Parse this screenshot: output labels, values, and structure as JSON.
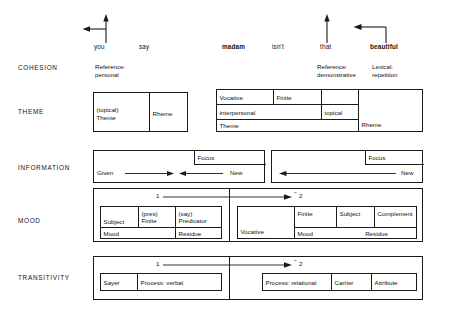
{
  "figure": {
    "clause_words": [
      {
        "text": "you",
        "bold": false,
        "x": 94,
        "y": 46
      },
      {
        "text": "say",
        "bold": false,
        "x": 139,
        "y": 46
      },
      {
        "text": "madam",
        "bold": true,
        "x": 222,
        "y": 46
      },
      {
        "text": "isn't",
        "bold": false,
        "x": 272,
        "y": 46
      },
      {
        "text": "that",
        "bold": false,
        "x": 320,
        "y": 46
      },
      {
        "text": "beautiful",
        "bold": true,
        "x": 370,
        "y": 46
      }
    ],
    "arrows": [
      {
        "name": "reference-personal-arrow",
        "kind": "up-left",
        "x": 82,
        "y": 14,
        "w": 28,
        "h": 30
      },
      {
        "name": "reference-demonstrative-arrow",
        "kind": "up",
        "x": 320,
        "y": 14,
        "w": 14,
        "h": 30
      },
      {
        "name": "lexical-repetition-arrow",
        "kind": "up-then-left",
        "x": 352,
        "y": 14,
        "w": 38,
        "h": 30
      }
    ],
    "rows": [
      {
        "label": "COHESION",
        "label_x": 18,
        "label_y": 68
      },
      {
        "label": "THEME",
        "label_x": 18,
        "label_y": 112
      },
      {
        "label": "INFORMATION",
        "label_x": 18,
        "label_y": 168
      },
      {
        "label": "MOOD",
        "label_x": 18,
        "label_y": 221
      },
      {
        "label": "TRANSITIVITY",
        "label_x": 18,
        "label_y": 277
      }
    ],
    "cohesion": {
      "notes": [
        {
          "name": "cohesion-note-reference-personal",
          "lines": [
            "Reference:",
            "personal"
          ],
          "x": 95,
          "y": 66
        },
        {
          "name": "cohesion-note-reference-demonstrative",
          "lines": [
            "Reference:",
            "demonstrative"
          ],
          "x": 317,
          "y": 66
        },
        {
          "name": "cohesion-note-lexical-repetition",
          "lines": [
            "Lexical:",
            "repetition"
          ],
          "x": 372,
          "y": 66
        }
      ]
    },
    "theme": {
      "left_box": {
        "x": 93,
        "y": 92,
        "w": 95,
        "h": 40,
        "divider_x": 55,
        "cells": [
          {
            "name": "theme-cell-topical-theme",
            "lines": [
              "(topical)",
              "Theme"
            ]
          },
          {
            "name": "theme-cell-rheme",
            "lines": [
              "Rheme"
            ]
          }
        ]
      },
      "right_box": {
        "x": 216,
        "y": 89,
        "w": 207,
        "h": 43,
        "cells": [
          {
            "name": "theme-cell-vocative",
            "text": "Vocative",
            "x": 0,
            "y": 0,
            "w": 56,
            "h": 14
          },
          {
            "name": "theme-cell-finite",
            "text": "Finite",
            "x": 56,
            "y": 0,
            "w": 48,
            "h": 14
          },
          {
            "name": "theme-cell-blank-top",
            "text": "",
            "x": 104,
            "y": 0,
            "w": 37,
            "h": 14
          },
          {
            "name": "theme-cell-interpersonal",
            "text": "interpersonal",
            "x": 0,
            "y": 14,
            "w": 104,
            "h": 15
          },
          {
            "name": "theme-cell-topical",
            "text": "topical",
            "x": 104,
            "y": 14,
            "w": 37,
            "h": 15
          },
          {
            "name": "theme-cell-theme",
            "text": "Theme",
            "x": 0,
            "y": 29,
            "w": 141,
            "h": 14
          },
          {
            "name": "theme-cell-rheme-right",
            "text": "Rheme",
            "x": 141,
            "y": 0,
            "w": 66,
            "h": 43
          }
        ]
      }
    },
    "information": {
      "left_box": {
        "x": 93,
        "y": 150,
        "w": 172,
        "h": 33,
        "focus_label": "Focus",
        "focus_x": 100,
        "focus_y": 0,
        "focus_w": 72,
        "focus_h": 14,
        "given_label": "Given",
        "new_label": "New",
        "arrow_style": "double-inward"
      },
      "right_box": {
        "x": 271,
        "y": 150,
        "w": 152,
        "h": 33,
        "focus_label": "Focus",
        "focus_x": 93,
        "focus_y": 0,
        "focus_w": 59,
        "focus_h": 14,
        "given_label": "",
        "new_label": "New",
        "arrow_style": "single-left"
      }
    },
    "mood": {
      "outer": {
        "x": 93,
        "y": 188,
        "w": 330,
        "h": 54,
        "split_x": 135
      },
      "clause_markers": {
        "one": "1",
        "two": "2",
        "two_superscript": "''",
        "one_x": 62,
        "two_x": 199,
        "y": 5,
        "arrow_from": 70,
        "arrow_to": 196
      },
      "left_box": {
        "x": 6,
        "y": 17,
        "w": 122,
        "h": 33,
        "top_cells": [
          {
            "name": "mood-cell-subject",
            "lines": [
              "Subject"
            ],
            "w": 38,
            "valign": "bottom"
          },
          {
            "name": "mood-cell-finite",
            "lines": [
              "(pres)",
              "Finite"
            ],
            "w": 37,
            "valign": "top"
          },
          {
            "name": "mood-cell-predicator",
            "lines": [
              "(say)",
              "Predicator"
            ],
            "w": 47,
            "valign": "top"
          }
        ],
        "bottom_cells": [
          {
            "name": "mood-cell-mood",
            "text": "Mood",
            "w": 75
          },
          {
            "name": "mood-cell-residue",
            "text": "Residue",
            "w": 47
          }
        ]
      },
      "right_box": {
        "x": 143,
        "y": 17,
        "w": 180,
        "h": 33,
        "vocative": {
          "name": "mood-cell-vocative",
          "text": "Vocative",
          "w": 57
        },
        "top_cells": [
          {
            "name": "mood-cell-finite-right",
            "text": "Finite",
            "w": 42
          },
          {
            "name": "mood-cell-subject-right",
            "text": "Subject",
            "w": 38
          },
          {
            "name": "mood-cell-complement",
            "text": "Complement",
            "w": 43
          }
        ],
        "bottom_cells": [
          {
            "name": "mood-cell-mood-right",
            "text": "Mood",
            "w": 42,
            "align": "left"
          },
          {
            "name": "mood-cell-residue-right",
            "text": "Residue",
            "w": 81,
            "align": "center"
          }
        ]
      }
    },
    "transitivity": {
      "outer": {
        "x": 93,
        "y": 256,
        "w": 330,
        "h": 44,
        "split_x": 135
      },
      "clause_markers": {
        "one": "1",
        "two": "2",
        "two_superscript": "''",
        "one_x": 62,
        "two_x": 199,
        "y": 5,
        "arrow_from": 70,
        "arrow_to": 196
      },
      "left_box": {
        "x": 6,
        "y": 16,
        "w": 122,
        "h": 18,
        "cells": [
          {
            "name": "transitivity-cell-sayer",
            "text": "Sayer",
            "w": 37
          },
          {
            "name": "transitivity-cell-process-verbal",
            "text": "Process: verbal",
            "w": 85
          }
        ]
      },
      "right_box": {
        "x": 168,
        "y": 16,
        "w": 155,
        "h": 18,
        "cells": [
          {
            "name": "transitivity-cell-process-relational",
            "text": "Process: relational",
            "w": 69
          },
          {
            "name": "transitivity-cell-carrier",
            "text": "Carrier",
            "w": 40
          },
          {
            "name": "transitivity-cell-attribute",
            "text": "Attribute",
            "w": 46
          }
        ]
      }
    },
    "colors": {
      "ink": "#1a1a1a",
      "background": "#ffffff"
    }
  }
}
